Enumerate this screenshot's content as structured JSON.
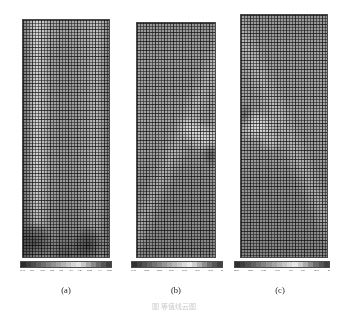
{
  "figure": {
    "background": "#ffffff",
    "partial_caption": "图   等值线云图"
  },
  "panels": [
    {
      "id": "a",
      "label": "(a)",
      "mesh": "structured-quadrilateral-fem-mesh",
      "description": "contour field with dark low-value blobs near bottom-left and bottom-right corners and a light vertical band along the left side",
      "colorbar": {
        "name": "colorbar-a",
        "ticks": [
          "79.41",
          "3.01",
          "48.01",
          "8.63",
          "0.63",
          "45.4",
          "7.29",
          "20.82",
          "94.4",
          "62.86"
        ],
        "colors": [
          "#2b2b2b",
          "#3c3c3c",
          "#4d4d4d",
          "#5e5e5e",
          "#6f6f6f",
          "#808080",
          "#919191",
          "#a2a2a2",
          "#b3b3b3",
          "#c4c4c4",
          "#d5d5d5",
          "#e2e2e2",
          "#c8c8c8",
          "#a8a8a8",
          "#8a8a8a",
          "#6c6c6c",
          "#555555",
          "#3f3f3f"
        ]
      }
    },
    {
      "id": "b",
      "label": "(b)",
      "mesh": "structured-quadrilateral-fem-mesh",
      "description": "contour field with a bright diagonal wedge in the mid-right region",
      "colorbar": {
        "name": "colorbar-b",
        "ticks": [
          "74.40",
          "92.03",
          "58.03",
          "57.00",
          "54.07",
          "91.04",
          "91.07",
          "19"
        ],
        "colors": [
          "#303030",
          "#414141",
          "#525252",
          "#636363",
          "#747474",
          "#858585",
          "#969696",
          "#a7a7a7",
          "#b8b8b8",
          "#c9c9c9",
          "#dadada",
          "#e8e8e8",
          "#cfcfcf",
          "#b0b0b0",
          "#909090",
          "#707070",
          "#575757",
          "#424242"
        ]
      }
    },
    {
      "id": "c",
      "label": "(c)",
      "mesh": "structured-quadrilateral-fem-mesh",
      "description": "contour field with a bright diagonal wedge in the mid-left region",
      "colorbar": {
        "name": "colorbar-c",
        "ticks": [
          "22.59",
          "83.56",
          "04.58",
          "04.59",
          "10.0",
          "1.59",
          "62.97",
          "87"
        ],
        "colors": [
          "#2e2e2e",
          "#3f3f3f",
          "#505050",
          "#616161",
          "#727272",
          "#838383",
          "#949494",
          "#a5a5a5",
          "#b6b6b6",
          "#c7c7c7",
          "#d8d8d8",
          "#e6e6e6",
          "#cccccc",
          "#adadad",
          "#8d8d8d",
          "#6d6d6d",
          "#565656",
          "#404040"
        ]
      }
    }
  ]
}
